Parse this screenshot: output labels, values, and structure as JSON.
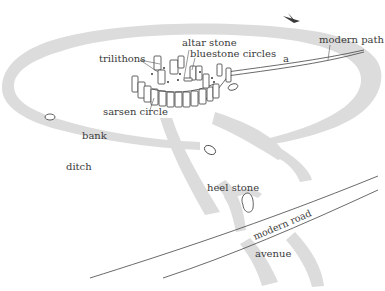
{
  "diagram": {
    "colors": {
      "earthwork": "#dcdcdc",
      "outline": "#3a3a3a",
      "label": "#3a3a3a",
      "background": "#ffffff"
    },
    "labels": {
      "trilithons": "trilithons",
      "altar_stone": "altar stone",
      "bluestone_circles": "bluestone circles",
      "modern_path": "modern path",
      "sarsen_circle": "sarsen circle",
      "bank": "bank",
      "ditch": "ditch",
      "heel_stone": "heel stone",
      "modern_road": "modern road",
      "avenue": "avenue",
      "marker_a": "a"
    },
    "icons": {
      "north_arrow": "compass-arrow-icon"
    }
  }
}
